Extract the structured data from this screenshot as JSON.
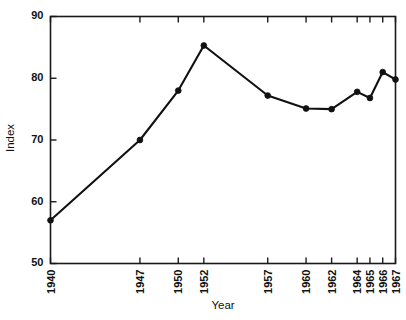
{
  "chart_data": {
    "type": "line",
    "title": "",
    "xlabel": "Year",
    "ylabel": "Index",
    "categories": [
      "1940",
      "1947",
      "1950",
      "1952",
      "1957",
      "1960",
      "1962",
      "1964",
      "1965",
      "1966",
      "1967"
    ],
    "x": [
      1940,
      1947,
      1950,
      1952,
      1957,
      1960,
      1962,
      1964,
      1965,
      1966,
      1967
    ],
    "values": [
      57.0,
      70.0,
      78.0,
      85.3,
      77.2,
      75.1,
      75.0,
      77.8,
      76.8,
      81.0,
      79.8
    ],
    "series": [
      {
        "name": "Index",
        "values": [
          57.0,
          70.0,
          78.0,
          85.3,
          77.2,
          75.1,
          75.0,
          77.8,
          76.8,
          81.0,
          79.8
        ]
      }
    ],
    "xlim": [
      1940,
      1967
    ],
    "ylim": [
      50,
      90
    ],
    "y_ticks": [
      50,
      60,
      70,
      80,
      90
    ],
    "y_tick_labels": [
      "50",
      "60",
      "70",
      "80",
      "90"
    ],
    "x_ticks": [
      1940,
      1947,
      1950,
      1952,
      1957,
      1960,
      1962,
      1964,
      1965,
      1966,
      1967
    ],
    "x_tick_labels": [
      "1940",
      "1947",
      "1950",
      "1952",
      "1957",
      "1960",
      "1962",
      "1964",
      "1965",
      "1966",
      "1967"
    ],
    "grid": false,
    "legend": "none",
    "marker": "filled-circle",
    "line_color": "#111111",
    "marker_color": "#111111",
    "axis_color": "#1a1a1a",
    "background_color": "#ffffff",
    "frame": "box",
    "tick_direction": "in",
    "x_tick_label_rotation": 90
  }
}
